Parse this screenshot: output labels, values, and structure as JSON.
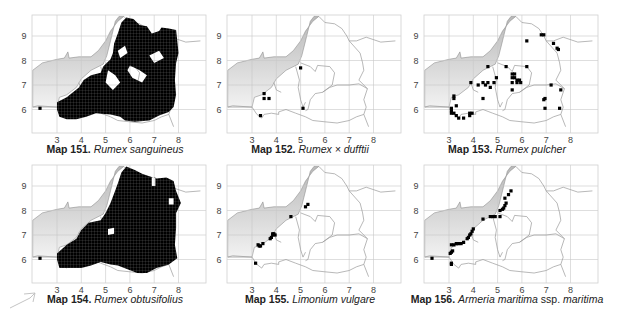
{
  "page": {
    "colors": {
      "sea_dark": "#b9b9b9",
      "sea_light": "#f2f2f2",
      "grid": "#c8c8c8",
      "border": "#9a9a9a",
      "frame": "#d0d0d0",
      "dot": "#000000"
    },
    "axes": {
      "x_ticks": [
        "3",
        "4",
        "5",
        "6",
        "7",
        "8"
      ],
      "y_ticks": [
        "9",
        "8",
        "7",
        "6"
      ]
    },
    "maps": [
      {
        "id": "map151",
        "num_label": "Map 151.",
        "species": "Rumex sanguineus",
        "qualifier": "",
        "pattern": "dense",
        "dense_region": "coverage-151",
        "dots": [
          [
            2.3,
            6.05
          ]
        ]
      },
      {
        "id": "map152",
        "num_label": "Map 152.",
        "species": "Rumex × dufftii",
        "qualifier": "",
        "pattern": "sparse",
        "dots": [
          [
            3.5,
            6.65
          ],
          [
            3.5,
            6.45
          ],
          [
            3.7,
            6.45
          ],
          [
            3.35,
            5.75
          ],
          [
            5.0,
            7.7
          ],
          [
            5.1,
            6.05
          ]
        ]
      },
      {
        "id": "map153",
        "num_label": "Map 153.",
        "species": "Rumex pulcher",
        "qualifier": "",
        "pattern": "sparse",
        "dots": [
          [
            3.2,
            6.55
          ],
          [
            3.2,
            6.45
          ],
          [
            3.3,
            6.15
          ],
          [
            3.1,
            6.05
          ],
          [
            3.1,
            5.95
          ],
          [
            3.2,
            5.85
          ],
          [
            3.3,
            5.75
          ],
          [
            3.4,
            5.65
          ],
          [
            3.6,
            5.65
          ],
          [
            3.1,
            5.85
          ],
          [
            3.85,
            5.85
          ],
          [
            3.95,
            5.85
          ],
          [
            3.85,
            5.75
          ],
          [
            3.9,
            7.1
          ],
          [
            4.2,
            7.0
          ],
          [
            4.4,
            7.1
          ],
          [
            4.5,
            7.0
          ],
          [
            4.6,
            7.1
          ],
          [
            4.7,
            6.9
          ],
          [
            4.85,
            7.1
          ],
          [
            4.4,
            6.45
          ],
          [
            4.6,
            7.75
          ],
          [
            4.95,
            7.3
          ],
          [
            5.35,
            7.75
          ],
          [
            5.6,
            7.45
          ],
          [
            5.7,
            7.45
          ],
          [
            5.6,
            7.3
          ],
          [
            5.7,
            7.3
          ],
          [
            5.8,
            7.2
          ],
          [
            5.9,
            7.2
          ],
          [
            5.95,
            7.1
          ],
          [
            5.6,
            7.1
          ],
          [
            5.8,
            7.1
          ],
          [
            5.6,
            6.8
          ],
          [
            6.2,
            7.75
          ],
          [
            6.2,
            8.8
          ],
          [
            6.8,
            9.05
          ],
          [
            6.9,
            9.05
          ],
          [
            7.3,
            8.7
          ],
          [
            7.45,
            8.5
          ],
          [
            7.5,
            8.45
          ],
          [
            7.2,
            7.0
          ],
          [
            7.6,
            6.8
          ],
          [
            6.9,
            6.4
          ],
          [
            6.95,
            6.45
          ],
          [
            6.95,
            6.05
          ],
          [
            7.55,
            6.05
          ]
        ]
      },
      {
        "id": "map154",
        "num_label": "Map 154.",
        "species": "Rumex obtusifolius",
        "qualifier": "",
        "pattern": "dense",
        "dense_region": "coverage-154",
        "dots": [
          [
            2.3,
            6.05
          ]
        ]
      },
      {
        "id": "map155",
        "num_label": "Map 155.",
        "species": "Limonium vulgare",
        "qualifier": "",
        "pattern": "sparse",
        "dots": [
          [
            3.25,
            6.6
          ],
          [
            3.3,
            6.55
          ],
          [
            3.35,
            6.55
          ],
          [
            3.45,
            6.65
          ],
          [
            3.75,
            6.85
          ],
          [
            3.8,
            6.9
          ],
          [
            3.85,
            7.0
          ],
          [
            3.85,
            7.05
          ],
          [
            3.9,
            7.05
          ],
          [
            3.95,
            7.0
          ],
          [
            4.6,
            7.75
          ],
          [
            5.2,
            8.15
          ],
          [
            5.3,
            8.25
          ],
          [
            3.15,
            5.85
          ]
        ]
      },
      {
        "id": "map156",
        "num_label": "Map 156.",
        "species": "Armeria maritima",
        "qualifier": "ssp.",
        "species2": "maritima",
        "pattern": "sparse",
        "dots": [
          [
            2.3,
            6.05
          ],
          [
            3.05,
            6.25
          ],
          [
            3.1,
            6.3
          ],
          [
            3.15,
            6.35
          ],
          [
            3.1,
            5.85
          ],
          [
            3.1,
            5.8
          ],
          [
            3.1,
            6.6
          ],
          [
            3.2,
            6.6
          ],
          [
            3.3,
            6.65
          ],
          [
            3.4,
            6.65
          ],
          [
            3.5,
            6.65
          ],
          [
            3.6,
            6.7
          ],
          [
            3.75,
            6.85
          ],
          [
            3.8,
            6.9
          ],
          [
            3.85,
            7.0
          ],
          [
            3.9,
            7.05
          ],
          [
            3.95,
            7.15
          ],
          [
            4.0,
            7.25
          ],
          [
            4.4,
            7.65
          ],
          [
            4.7,
            7.75
          ],
          [
            4.8,
            7.75
          ],
          [
            4.9,
            7.75
          ],
          [
            5.1,
            7.75
          ],
          [
            5.1,
            8.0
          ],
          [
            5.2,
            8.05
          ],
          [
            5.25,
            8.1
          ],
          [
            5.3,
            8.2
          ],
          [
            5.35,
            8.3
          ],
          [
            5.3,
            8.5
          ],
          [
            5.45,
            8.65
          ],
          [
            5.55,
            8.8
          ]
        ]
      }
    ],
    "decor": {
      "corner_arrow": "arrow-sketch"
    }
  }
}
